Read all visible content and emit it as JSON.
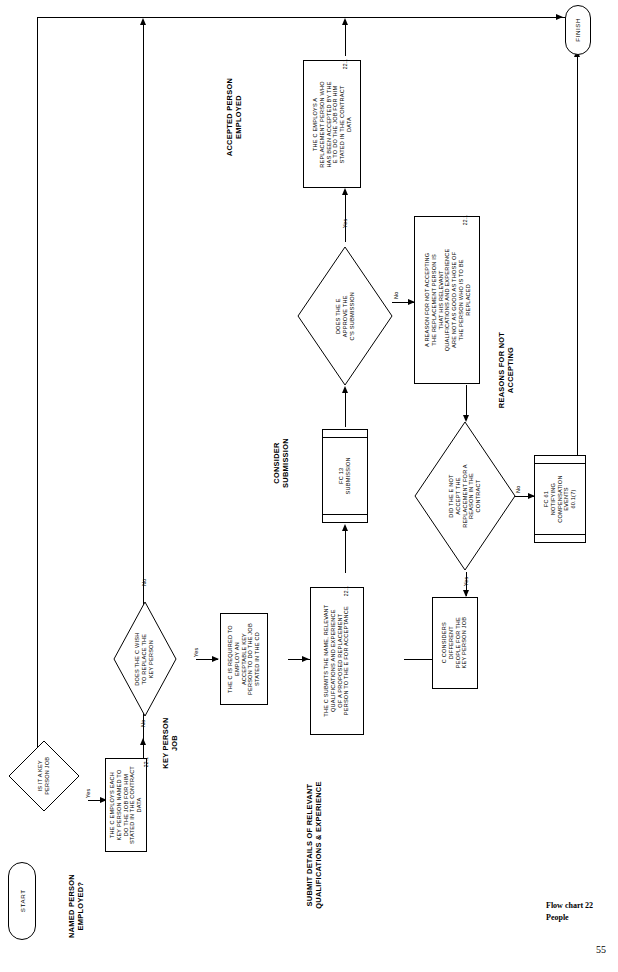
{
  "document": {
    "footer_title": "Flow chart 22",
    "footer_subtitle": "People",
    "page_number": "55"
  },
  "nodes": {
    "start": {
      "label": "START"
    },
    "finish": {
      "label": "FINISH"
    },
    "d1": {
      "label": "IS IT A KEY\nPERSON JOB"
    },
    "p1": {
      "ref": "22.1",
      "label": "THE C EMPLOYS EACH\nKEY PERSON NAMED TO\nDO THE JOB FOR HIM\nSTATED IN THE CONTRACT\nDATA"
    },
    "d2": {
      "label": "DOES THE C WISH\nTO REPLACE THE\nKEY PERSON"
    },
    "p2": {
      "ref": "",
      "label": "THE C IS REQUIRED TO\nEMPLOY AN\nACCEPTABLE KEY\nPERSON TO DO THE JOB\nSTATED IN THE CD"
    },
    "p3": {
      "ref": "22.1",
      "label": "THE C SUBMITS THE NAME, RELEVANT\nQUALIFICATIONS AND EXPERIENCE\nOF A PROPOSED REPLACEMENT\nPERSON TO THE E FOR ACCEPTANCE"
    },
    "fc13": {
      "label": "FC 13\nSUBMISSION"
    },
    "d3": {
      "label": "DOES THE E\nAPPROVE THE\nC'S SUBMISSION"
    },
    "p4": {
      "ref": "22.1",
      "label": "THE C EMPLOYS A\nREPLACEMENT PERSON WHO\nHAS BEEN ACCEPTED BY THE\nE TO DO THE JOB FOR HIM\nSTATED IN THE CONTRACT\nDATA"
    },
    "p5": {
      "ref": "22.1",
      "label": "A REASON FOR NOT ACCEPTING\nTHE REPLACEMENT PERSON IS\nTHAT HIS RELEVANT\nQUALIFICATIONS AND EXPERIENCE\nARE NOT AS GOOD AS THOSE OF\nTHE PERSON WHO IS TO BE\nREPLACED"
    },
    "d4": {
      "label": "DID THE E NOT\nACCEPT THE\nREPLACEMENT FOR A\nREASON IN THE\nCONTRACT"
    },
    "p6": {
      "ref": "",
      "label": "C CONSIDERS\nDIFFERENT\nPEOPLE FOR THE\nKEY PERSON JOB"
    },
    "fc61": {
      "label": "FC 61\nNOTIFYING\nCOMPENSATION\nEVENTS\n60.1(7)"
    }
  },
  "captions": {
    "key_person_job": "KEY PERSON\nJOB",
    "named_person_employed": "NAMED PERSON\nEMPLOYED?",
    "submit_details": "SUBMIT DETAILS OF RELEVANT\nQUALIFICATIONS & EXPERIENCE",
    "consider_submission": "CONSIDER\nSUBMISSION",
    "accepted_person_employed": "ACCEPTED PERSON\nEMPLOYED",
    "reasons_for_not_accepting": "REASONS FOR NOT\nACCEPTING"
  },
  "branch_labels": {
    "d1_no": "No",
    "d1_yes": "Yes",
    "d2_no": "No",
    "d2_yes": "Yes",
    "d3_yes": "Yes",
    "d3_no": "No",
    "d4_yes": "Yes",
    "d4_no": "No"
  },
  "colors": {
    "line": "#000000",
    "background": "#ffffff"
  }
}
